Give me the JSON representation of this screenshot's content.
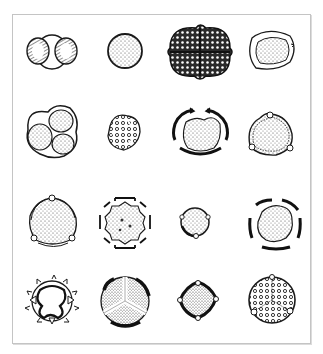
{
  "figure": {
    "layout": {
      "rows": 4,
      "columns": 4
    },
    "colors": {
      "ink": "#1a1a1a",
      "stipple": "#555555",
      "frame": "#c4c4c4",
      "background": "#ffffff"
    },
    "grains": [
      {
        "row": 1,
        "col": 1,
        "name": "bisaccate-grain"
      },
      {
        "row": 1,
        "col": 2,
        "name": "spherical-inaperturate-grain"
      },
      {
        "row": 1,
        "col": 3,
        "name": "tetrad-reticulate-grain"
      },
      {
        "row": 1,
        "col": 4,
        "name": "thick-walled-monoporate-grain"
      },
      {
        "row": 2,
        "col": 1,
        "name": "triad-tetrad-grain"
      },
      {
        "row": 2,
        "col": 2,
        "name": "reticulate-triangular-grain"
      },
      {
        "row": 2,
        "col": 3,
        "name": "tricolpate-grain-thick-exine"
      },
      {
        "row": 2,
        "col": 4,
        "name": "triporate-annulate-grain"
      },
      {
        "row": 3,
        "col": 1,
        "name": "triporate-grain"
      },
      {
        "row": 3,
        "col": 2,
        "name": "stephanocolpate-grain"
      },
      {
        "row": 3,
        "col": 3,
        "name": "small-triporate-grain"
      },
      {
        "row": 3,
        "col": 4,
        "name": "pentacolpate-grain"
      },
      {
        "row": 4,
        "col": 1,
        "name": "echinate-tricolporate-grain"
      },
      {
        "row": 4,
        "col": 2,
        "name": "trilete-spore"
      },
      {
        "row": 4,
        "col": 3,
        "name": "tetraporate-grain"
      },
      {
        "row": 4,
        "col": 4,
        "name": "reticulate-periporate-grain"
      }
    ]
  }
}
